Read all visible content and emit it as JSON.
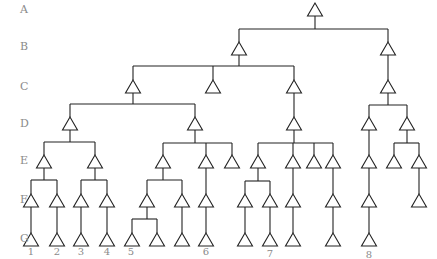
{
  "colors": {
    "line": "#222222",
    "label": "#8a8a8a",
    "background": "#ffffff"
  },
  "levels": [
    {
      "label": "A",
      "y": 4
    },
    {
      "label": "B",
      "y": 41
    },
    {
      "label": "C",
      "y": 81
    },
    {
      "label": "D",
      "y": 118
    },
    {
      "label": "E",
      "y": 155
    },
    {
      "label": "F",
      "y": 194
    },
    {
      "label": "G",
      "y": 233
    }
  ],
  "node_y": {
    "A": 3,
    "B": 42,
    "C": 80,
    "D": 117,
    "E": 155,
    "F": 194,
    "G": 233
  },
  "nodes": [
    {
      "id": "a1",
      "level": "A",
      "x": 315
    },
    {
      "id": "b1",
      "level": "B",
      "x": 239,
      "parent": "a1",
      "split_y": 29
    },
    {
      "id": "b2",
      "level": "B",
      "x": 388,
      "parent": "a1",
      "split_y": 29
    },
    {
      "id": "c1",
      "level": "C",
      "x": 133,
      "parent": "b1",
      "split_y": 66
    },
    {
      "id": "c2",
      "level": "C",
      "x": 213,
      "parent": "b1",
      "split_y": 66
    },
    {
      "id": "c3",
      "level": "C",
      "x": 294,
      "parent": "b1",
      "split_y": 66
    },
    {
      "id": "c4",
      "level": "C",
      "x": 388,
      "parent": "b2"
    },
    {
      "id": "d1",
      "level": "D",
      "x": 70,
      "parent": "c1",
      "split_y": 104
    },
    {
      "id": "d2",
      "level": "D",
      "x": 195,
      "parent": "c1",
      "split_y": 104
    },
    {
      "id": "d3",
      "level": "D",
      "x": 294,
      "parent": "c3"
    },
    {
      "id": "d4",
      "level": "D",
      "x": 369,
      "parent": "c4",
      "split_y": 105
    },
    {
      "id": "d5",
      "level": "D",
      "x": 407,
      "parent": "c4",
      "split_y": 105
    },
    {
      "id": "e1",
      "level": "E",
      "x": 44,
      "parent": "d1",
      "split_y": 142
    },
    {
      "id": "e2",
      "level": "E",
      "x": 95,
      "parent": "d1",
      "split_y": 142
    },
    {
      "id": "e3",
      "level": "E",
      "x": 163,
      "parent": "d2",
      "split_y": 143
    },
    {
      "id": "e4",
      "level": "E",
      "x": 206,
      "parent": "d2",
      "split_y": 143
    },
    {
      "id": "e5",
      "level": "E",
      "x": 232,
      "parent": "d2",
      "split_y": 143
    },
    {
      "id": "e6",
      "level": "E",
      "x": 258,
      "parent": "d3",
      "split_y": 143
    },
    {
      "id": "e7",
      "level": "E",
      "x": 293,
      "parent": "d3",
      "split_y": 143
    },
    {
      "id": "e8",
      "level": "E",
      "x": 314,
      "parent": "d3",
      "split_y": 143
    },
    {
      "id": "e9",
      "level": "E",
      "x": 333,
      "parent": "d3",
      "split_y": 143
    },
    {
      "id": "e10",
      "level": "E",
      "x": 369,
      "parent": "d4"
    },
    {
      "id": "e11",
      "level": "E",
      "x": 394,
      "parent": "d5",
      "split_y": 143
    },
    {
      "id": "e12",
      "level": "E",
      "x": 419,
      "parent": "d5",
      "split_y": 143
    },
    {
      "id": "f1",
      "level": "F",
      "x": 31,
      "parent": "e1",
      "split_y": 180
    },
    {
      "id": "f2",
      "level": "F",
      "x": 57,
      "parent": "e1",
      "split_y": 180
    },
    {
      "id": "f3",
      "level": "F",
      "x": 81,
      "parent": "e2",
      "split_y": 180
    },
    {
      "id": "f4",
      "level": "F",
      "x": 107,
      "parent": "e2",
      "split_y": 180
    },
    {
      "id": "f5",
      "level": "F",
      "x": 147,
      "parent": "e3",
      "split_y": 180
    },
    {
      "id": "f6",
      "level": "F",
      "x": 182,
      "parent": "e3",
      "split_y": 180
    },
    {
      "id": "f7",
      "level": "F",
      "x": 206,
      "parent": "e4"
    },
    {
      "id": "f8",
      "level": "F",
      "x": 245,
      "parent": "e6",
      "split_y": 181
    },
    {
      "id": "f9",
      "level": "F",
      "x": 270,
      "parent": "e6",
      "split_y": 181
    },
    {
      "id": "f10",
      "level": "F",
      "x": 293,
      "parent": "e7"
    },
    {
      "id": "f11",
      "level": "F",
      "x": 333,
      "parent": "e9"
    },
    {
      "id": "f12",
      "level": "F",
      "x": 369,
      "parent": "e10"
    },
    {
      "id": "f13",
      "level": "F",
      "x": 419,
      "parent": "e12"
    },
    {
      "id": "g1",
      "level": "G",
      "x": 31,
      "parent": "f1"
    },
    {
      "id": "g2",
      "level": "G",
      "x": 57,
      "parent": "f2"
    },
    {
      "id": "g3",
      "level": "G",
      "x": 81,
      "parent": "f3"
    },
    {
      "id": "g4",
      "level": "G",
      "x": 107,
      "parent": "f4"
    },
    {
      "id": "g5",
      "level": "G",
      "x": 132,
      "parent": "f5",
      "split_y": 219
    },
    {
      "id": "g6",
      "level": "G",
      "x": 157,
      "parent": "f5",
      "split_y": 219
    },
    {
      "id": "g7",
      "level": "G",
      "x": 182,
      "parent": "f6"
    },
    {
      "id": "g8",
      "level": "G",
      "x": 206,
      "parent": "f7"
    },
    {
      "id": "g9",
      "level": "G",
      "x": 245,
      "parent": "f8"
    },
    {
      "id": "g10",
      "level": "G",
      "x": 270,
      "parent": "f9"
    },
    {
      "id": "g11",
      "level": "G",
      "x": 293,
      "parent": "f10"
    },
    {
      "id": "g12",
      "level": "G",
      "x": 333,
      "parent": "f11"
    },
    {
      "id": "g13",
      "level": "G",
      "x": 369,
      "parent": "f12"
    }
  ],
  "leaf_labels": [
    {
      "text": "1",
      "x": 31,
      "y": 247
    },
    {
      "text": "2",
      "x": 57,
      "y": 247
    },
    {
      "text": "3",
      "x": 81,
      "y": 247
    },
    {
      "text": "4",
      "x": 107,
      "y": 247
    },
    {
      "text": "5",
      "x": 131,
      "y": 247
    },
    {
      "text": "6",
      "x": 206,
      "y": 247
    },
    {
      "text": "7",
      "x": 270,
      "y": 249
    },
    {
      "text": "8",
      "x": 369,
      "y": 250
    }
  ]
}
